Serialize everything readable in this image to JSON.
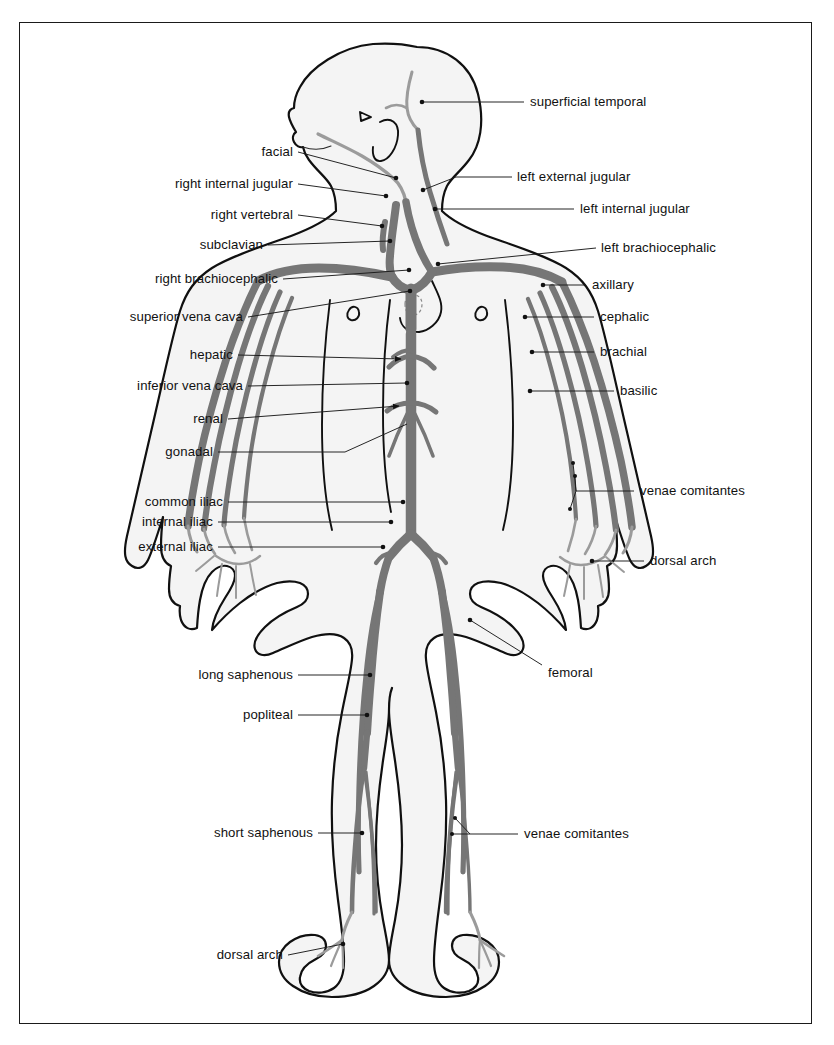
{
  "diagram": {
    "frame": {
      "border_color": "#1a1a1a"
    },
    "colors": {
      "vein": "#767676",
      "vein_light": "#9a9a9a",
      "outline": "#101010",
      "body_fill": "#f4f4f4",
      "leader_line": "#1a1a1a",
      "text": "#111111"
    },
    "labels_left": [
      {
        "id": "facial",
        "text": "facial"
      },
      {
        "id": "right-internal-jugular",
        "text": "right internal jugular"
      },
      {
        "id": "right-vertebral",
        "text": "right vertebral"
      },
      {
        "id": "subclavian",
        "text": "subclavian"
      },
      {
        "id": "right-brachiocephalic",
        "text": "right brachiocephalic"
      },
      {
        "id": "superior-vena-cava",
        "text": "superior vena cava"
      },
      {
        "id": "hepatic",
        "text": "hepatic"
      },
      {
        "id": "inferior-vena-cava",
        "text": "inferior vena cava"
      },
      {
        "id": "renal",
        "text": "renal"
      },
      {
        "id": "gonadal",
        "text": "gonadal"
      },
      {
        "id": "common-iliac",
        "text": "common iliac"
      },
      {
        "id": "internal-iliac",
        "text": "internal iliac"
      },
      {
        "id": "external-iliac",
        "text": "external iliac"
      },
      {
        "id": "long-saphenous",
        "text": "long saphenous"
      },
      {
        "id": "popliteal",
        "text": "popliteal"
      },
      {
        "id": "short-saphenous",
        "text": "short saphenous"
      },
      {
        "id": "dorsal-arch-foot",
        "text": "dorsal arch"
      }
    ],
    "labels_right": [
      {
        "id": "superficial-temporal",
        "text": "superficial temporal"
      },
      {
        "id": "left-external-jugular",
        "text": "left external jugular"
      },
      {
        "id": "left-internal-jugular",
        "text": "left internal jugular"
      },
      {
        "id": "left-brachiocephalic",
        "text": "left brachiocephalic"
      },
      {
        "id": "axillary",
        "text": "axillary"
      },
      {
        "id": "cephalic",
        "text": "cephalic"
      },
      {
        "id": "brachial",
        "text": "brachial"
      },
      {
        "id": "basilic",
        "text": "basilic"
      },
      {
        "id": "venae-comitantes-arm",
        "text": "venae comitantes"
      },
      {
        "id": "dorsal-arch-hand",
        "text": "dorsal arch"
      },
      {
        "id": "femoral",
        "text": "femoral"
      },
      {
        "id": "venae-comitantes-leg",
        "text": "venae comitantes"
      }
    ]
  }
}
